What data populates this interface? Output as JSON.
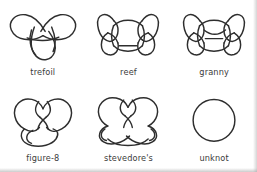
{
  "figure": {
    "background_color": "#ffffff",
    "stroke_color": "#2e2e2e",
    "label_color": "#3b3b3b",
    "rows": 2,
    "columns": 3
  },
  "knots": [
    {
      "id": "trefoil",
      "label": "trefoil",
      "crossings": 3,
      "shape": "three-lobed-clover"
    },
    {
      "id": "reef",
      "label": "reef",
      "crossings": 6,
      "shape": "two-side-loops-with-central-band"
    },
    {
      "id": "granny",
      "label": "granny",
      "crossings": 6,
      "shape": "two-side-loops-with-central-band"
    },
    {
      "id": "figure-8",
      "label": "figure-8",
      "crossings": 4,
      "shape": "heart-with-bottom-loop"
    },
    {
      "id": "stevedores",
      "label": "stevedore's",
      "crossings": 6,
      "shape": "heart-with-crossed-bottom-loops"
    },
    {
      "id": "unknot",
      "label": "unknot",
      "crossings": 0,
      "shape": "plain-circle"
    }
  ]
}
